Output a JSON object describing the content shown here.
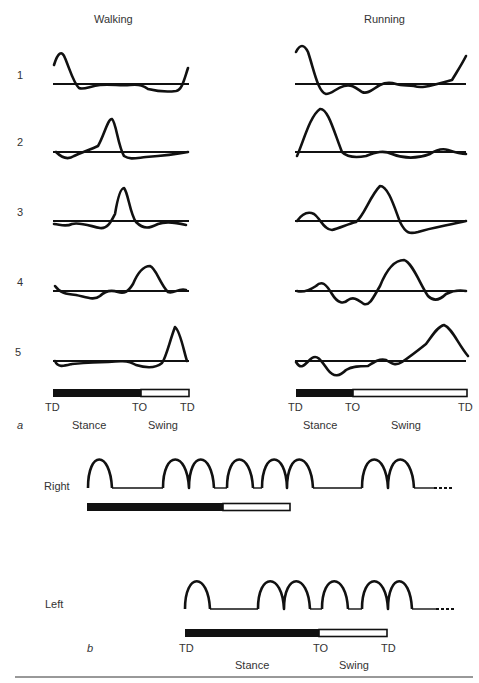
{
  "panel_a": {
    "label": "a",
    "columns": [
      {
        "title": "Walking",
        "phase_labels": {
          "td_start": "TD",
          "to": "TO",
          "td_end": "TD"
        },
        "stance": "Stance",
        "swing": "Swing"
      },
      {
        "title": "Running",
        "phase_labels": {
          "td_start": "TD",
          "to": "TO",
          "td_end": "TD"
        },
        "stance": "Stance",
        "swing": "Swing"
      }
    ],
    "rows": [
      "1",
      "2",
      "3",
      "4",
      "5"
    ]
  },
  "panel_b": {
    "label": "b",
    "right_label": "Right",
    "left_label": "Left",
    "phase_labels": {
      "td_start": "TD",
      "to": "TO",
      "td_end": "TD"
    },
    "stance": "Stance",
    "swing": "Swing"
  },
  "colors": {
    "ink": "#111111",
    "background": "#ffffff"
  }
}
